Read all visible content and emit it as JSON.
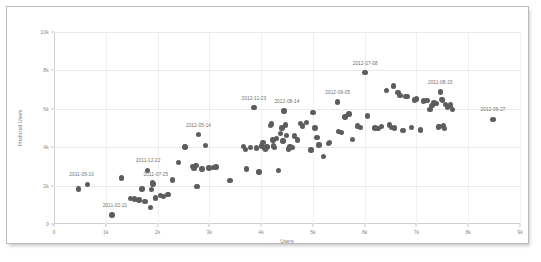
{
  "chart_data": {
    "type": "scatter",
    "title": "",
    "xlabel": "Users",
    "ylabel": "Predicted Users",
    "xlim": [
      0,
      9000
    ],
    "ylim": [
      0,
      10000
    ],
    "grid": true,
    "legend": "none",
    "xticks": [
      {
        "value": 0,
        "label": "0"
      },
      {
        "value": 1000,
        "label": "1k"
      },
      {
        "value": 2000,
        "label": "2k"
      },
      {
        "value": 3000,
        "label": "3k"
      },
      {
        "value": 4000,
        "label": "4k"
      },
      {
        "value": 5000,
        "label": "5k"
      },
      {
        "value": 6000,
        "label": "6k"
      },
      {
        "value": 7000,
        "label": "7k"
      },
      {
        "value": 8000,
        "label": "8k"
      },
      {
        "value": 9000,
        "label": "9k"
      }
    ],
    "yticks": [
      {
        "value": 0,
        "label": "0"
      },
      {
        "value": 2000,
        "label": "2k"
      },
      {
        "value": 4000,
        "label": "4k"
      },
      {
        "value": 6000,
        "label": "6k"
      },
      {
        "value": 8000,
        "label": "8k"
      },
      {
        "value": 10000,
        "label": "10k"
      }
    ],
    "marker_color": "#5d5d5d",
    "points": [
      [
        470,
        1830
      ],
      [
        650,
        2070
      ],
      [
        1120,
        460
      ],
      [
        1300,
        2390
      ],
      [
        1480,
        1320
      ],
      [
        1560,
        1300
      ],
      [
        1640,
        1250
      ],
      [
        1700,
        1820
      ],
      [
        1760,
        1180
      ],
      [
        1800,
        2790
      ],
      [
        1860,
        870
      ],
      [
        1880,
        1790
      ],
      [
        1900,
        2130
      ],
      [
        1910,
        2080
      ],
      [
        1960,
        1360
      ],
      [
        2060,
        1470
      ],
      [
        2120,
        1440
      ],
      [
        2200,
        1540
      ],
      [
        2290,
        2300
      ],
      [
        2400,
        3210
      ],
      [
        2530,
        4020
      ],
      [
        2670,
        3000
      ],
      [
        2700,
        2890
      ],
      [
        2740,
        3060
      ],
      [
        2760,
        1950
      ],
      [
        2790,
        4650
      ],
      [
        2860,
        2860
      ],
      [
        2930,
        4100
      ],
      [
        2990,
        2920
      ],
      [
        3080,
        2950
      ],
      [
        3130,
        2960
      ],
      [
        3400,
        2270
      ],
      [
        3660,
        4030
      ],
      [
        3700,
        3880
      ],
      [
        3720,
        2860
      ],
      [
        3800,
        4000
      ],
      [
        3860,
        6060
      ],
      [
        3910,
        3950
      ],
      [
        3960,
        2710
      ],
      [
        4010,
        4070
      ],
      [
        4040,
        4250
      ],
      [
        4060,
        3960
      ],
      [
        4080,
        3900
      ],
      [
        4110,
        4010
      ],
      [
        4180,
        5120
      ],
      [
        4200,
        5200
      ],
      [
        4230,
        4380
      ],
      [
        4240,
        4060
      ],
      [
        4260,
        3980
      ],
      [
        4300,
        4460
      ],
      [
        4330,
        2790
      ],
      [
        4380,
        4700
      ],
      [
        4400,
        5010
      ],
      [
        4420,
        4330
      ],
      [
        4440,
        5890
      ],
      [
        4470,
        5150
      ],
      [
        4490,
        4620
      ],
      [
        4530,
        3900
      ],
      [
        4560,
        4030
      ],
      [
        4600,
        4000
      ],
      [
        4640,
        4580
      ],
      [
        4700,
        4380
      ],
      [
        4760,
        5240
      ],
      [
        4800,
        5100
      ],
      [
        4880,
        5290
      ],
      [
        4960,
        3850
      ],
      [
        5000,
        5820
      ],
      [
        5040,
        5000
      ],
      [
        5080,
        4500
      ],
      [
        5120,
        4120
      ],
      [
        5210,
        3530
      ],
      [
        5300,
        4200
      ],
      [
        5320,
        4230
      ],
      [
        5480,
        6360
      ],
      [
        5500,
        4810
      ],
      [
        5550,
        4770
      ],
      [
        5620,
        5580
      ],
      [
        5700,
        5720
      ],
      [
        5760,
        4390
      ],
      [
        5860,
        5100
      ],
      [
        5920,
        5040
      ],
      [
        6010,
        7890
      ],
      [
        6050,
        5620
      ],
      [
        6200,
        5000
      ],
      [
        6260,
        4980
      ],
      [
        6320,
        5080
      ],
      [
        6420,
        6960
      ],
      [
        6480,
        5150
      ],
      [
        6520,
        5030
      ],
      [
        6560,
        7180
      ],
      [
        6580,
        5010
      ],
      [
        6640,
        6860
      ],
      [
        6680,
        6690
      ],
      [
        6740,
        4870
      ],
      [
        6800,
        6640
      ],
      [
        6820,
        6630
      ],
      [
        6900,
        5020
      ],
      [
        6960,
        6450
      ],
      [
        7000,
        6520
      ],
      [
        7080,
        4890
      ],
      [
        7140,
        6400
      ],
      [
        7200,
        6420
      ],
      [
        7260,
        5960
      ],
      [
        7300,
        6180
      ],
      [
        7340,
        6310
      ],
      [
        7380,
        6290
      ],
      [
        7420,
        5060
      ],
      [
        7440,
        5080
      ],
      [
        7460,
        6870
      ],
      [
        7480,
        6490
      ],
      [
        7500,
        6450
      ],
      [
        7520,
        5110
      ],
      [
        7540,
        4980
      ],
      [
        7560,
        6230
      ],
      [
        7600,
        6060
      ],
      [
        7660,
        6190
      ],
      [
        7700,
        5970
      ],
      [
        8480,
        5450
      ]
    ],
    "annotations": [
      {
        "label": "2011-05-10",
        "x": 650,
        "y": 2070,
        "dx": -6,
        "dy": -7
      },
      {
        "label": "2011-02-21",
        "x": 1120,
        "y": 460,
        "dx": 3,
        "dy": -7
      },
      {
        "label": "2011-12-22",
        "x": 1800,
        "y": 2790,
        "dx": 1,
        "dy": -7
      },
      {
        "label": "2011-07-25",
        "x": 1910,
        "y": 2080,
        "dx": 3,
        "dy": -7
      },
      {
        "label": "2012-05-14",
        "x": 2790,
        "y": 4650,
        "dx": 0,
        "dy": -7
      },
      {
        "label": "2012-11-23",
        "x": 3860,
        "y": 6060,
        "dx": 0,
        "dy": -7
      },
      {
        "label": "2012-08-14",
        "x": 4440,
        "y": 5890,
        "dx": 3,
        "dy": -7
      },
      {
        "label": "2012-06-05",
        "x": 5480,
        "y": 6360,
        "dx": 0,
        "dy": -7
      },
      {
        "label": "2012-07-08",
        "x": 6010,
        "y": 7890,
        "dx": 0,
        "dy": -7
      },
      {
        "label": "2011-08-23",
        "x": 7460,
        "y": 6870,
        "dx": 0,
        "dy": -7
      },
      {
        "label": "2012-09-27",
        "x": 8480,
        "y": 5450,
        "dx": 0,
        "dy": -7
      }
    ]
  }
}
